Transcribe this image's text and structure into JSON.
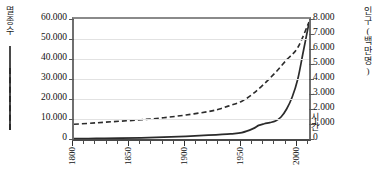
{
  "chart_data": {
    "type": "line",
    "title": "",
    "xlabel": "시간",
    "x_tick_labels": [
      "1800",
      "1850",
      "1900",
      "1950",
      "2000"
    ],
    "x_tick_values": [
      1800,
      1850,
      1900,
      1950,
      2000
    ],
    "xlim": [
      1800,
      2010
    ],
    "x_minor_tick_interval": 10,
    "grid": true,
    "legend_position": "outside-left-and-right",
    "axes": [
      {
        "side": "left",
        "label": "멸종 수",
        "label_chars": [
          "멸",
          "종",
          "수"
        ],
        "tick_labels": [
          "0",
          "10.000",
          "20.000",
          "30.000",
          "40.000",
          "50.000",
          "60.000"
        ],
        "tick_values": [
          0,
          10000,
          20000,
          30000,
          40000,
          50000,
          60000
        ],
        "ylim": [
          0,
          60000
        ],
        "series_style": "solid"
      },
      {
        "side": "right",
        "label": "인구(백만 명)",
        "label_chars": [
          "인",
          "구",
          "(",
          "백",
          "만",
          " ",
          "명",
          ")"
        ],
        "tick_labels": [
          "0",
          "1.000",
          "2.000",
          "3.000",
          "4.000",
          "5.000",
          "6.000",
          "7.000",
          "8.000"
        ],
        "tick_values": [
          0,
          1000,
          2000,
          3000,
          4000,
          5000,
          6000,
          7000,
          8000
        ],
        "ylim": [
          0,
          8000
        ],
        "series_style": "dashed"
      }
    ],
    "series": [
      {
        "name": "멸종 수",
        "axis": "left",
        "style": "solid",
        "color": "#2b2b2b",
        "x": [
          1800,
          1820,
          1840,
          1860,
          1880,
          1900,
          1920,
          1940,
          1950,
          1960,
          1965,
          1970,
          1975,
          1980,
          1985,
          1990,
          1995,
          2000,
          2005,
          2010
        ],
        "values": [
          200,
          300,
          400,
          600,
          900,
          1300,
          1900,
          2600,
          3200,
          5200,
          6800,
          7600,
          8200,
          9000,
          11000,
          15000,
          21000,
          30000,
          44000,
          58000
        ]
      },
      {
        "name": "인구(백만 명)",
        "axis": "right",
        "style": "dashed",
        "color": "#2b2b2b",
        "x": [
          1800,
          1820,
          1840,
          1860,
          1880,
          1900,
          1920,
          1930,
          1940,
          1950,
          1960,
          1970,
          1980,
          1990,
          2000,
          2010
        ],
        "values": [
          980,
          1080,
          1180,
          1280,
          1420,
          1600,
          1830,
          2000,
          2250,
          2520,
          3020,
          3680,
          4430,
          5280,
          6100,
          7800
        ]
      }
    ]
  },
  "plot": {
    "left_px": 72,
    "top_px": 17,
    "width_px": 235,
    "height_px": 120
  }
}
